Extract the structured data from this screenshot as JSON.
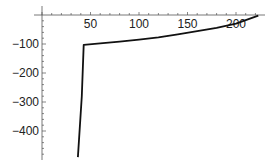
{
  "chart_data": {
    "type": "line",
    "title": "",
    "xlabel": "",
    "ylabel": "",
    "xlim": [
      0,
      225
    ],
    "ylim": [
      -500,
      0
    ],
    "grid": false,
    "legend": null,
    "x_ticks": [
      50,
      100,
      150,
      200
    ],
    "x_tick_labels": [
      "50",
      "100",
      "150",
      "200"
    ],
    "y_ticks": [
      -100,
      -200,
      -300,
      -400
    ],
    "y_tick_labels": [
      "−100",
      "−200",
      "−300",
      "−400"
    ],
    "series": [
      {
        "name": "curve",
        "color": "#111111",
        "x": [
          37,
          41,
          43,
          60,
          80,
          100,
          120,
          140,
          160,
          180,
          200,
          223
        ],
        "y": [
          -490,
          -280,
          -103,
          -98,
          -92,
          -85,
          -77,
          -67,
          -56,
          -44,
          -30,
          -2
        ]
      }
    ]
  }
}
